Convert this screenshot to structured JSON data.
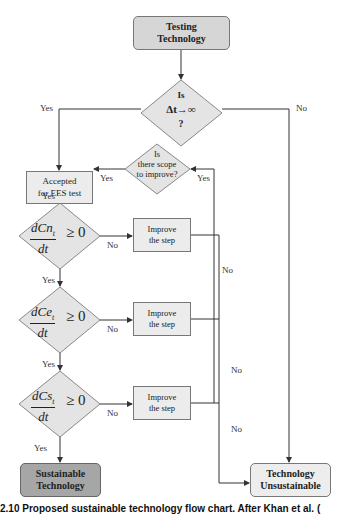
{
  "diagram": {
    "title": "Proposed sustainable technology flow chart",
    "nodes": {
      "start": {
        "label_line1": "Testing",
        "label_line2": "Technology"
      },
      "decision_time": {
        "line1": "Is",
        "line2": "Δt→∞",
        "line3": "?"
      },
      "accepted": {
        "line1": "Accepted",
        "line2": "for EES test"
      },
      "scope": {
        "line1": "Is",
        "line2": "there scope",
        "line3": "to improve?"
      },
      "decision_cn": {
        "numerator": "dCn",
        "subscript": "t",
        "denominator": "dt",
        "relation": "≥ 0"
      },
      "decision_ce": {
        "numerator": "dCe",
        "subscript": "t",
        "denominator": "dt",
        "relation": "≥ 0"
      },
      "decision_cs": {
        "numerator": "dCs",
        "subscript": "t",
        "denominator": "dt",
        "relation": "≥ 0"
      },
      "improve_1": {
        "line1": "Improve",
        "line2": "the step"
      },
      "improve_2": {
        "line1": "Improve",
        "line2": "the step"
      },
      "improve_3": {
        "line1": "Improve",
        "line2": "the step"
      },
      "sustainable": {
        "line1": "Sustainable",
        "line2": "Technology"
      },
      "unsustainable": {
        "line1": "Technology",
        "line2": "Unsustainable"
      }
    },
    "edge_labels": {
      "time_yes": "Yes",
      "time_no": "No",
      "scope_yes_left": "Yes",
      "scope_yes_right": "Yes",
      "accepted_yes": "Yes",
      "cn_no": "No",
      "cn_yes": "Yes",
      "ce_no": "No",
      "ce_yes": "Yes",
      "cs_no": "No",
      "cs_yes": "Yes",
      "loop_no_1": "No",
      "loop_no_2": "No",
      "loop_no_3": "No",
      "loop_no_4": "No"
    },
    "colors": {
      "start_fill": "#d6d6d6",
      "decision_fill": "#e4e4e4",
      "process_fill": "#ececec",
      "sustainable_fill": "#a6a6a6",
      "unsustainable_fill": "#ededed",
      "line": "#333333"
    }
  },
  "caption": {
    "text": "2.10   Proposed sustainable technology flow chart. After Khan et al. ("
  }
}
